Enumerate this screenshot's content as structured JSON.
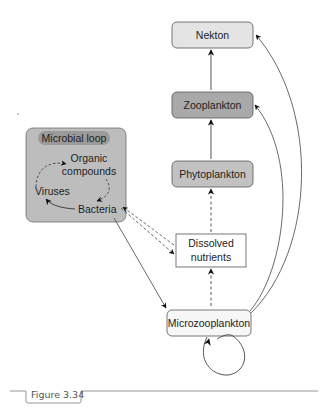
{
  "figure": {
    "caption": "Figure 3.34"
  },
  "nodes": {
    "nekton": {
      "label": "Nekton",
      "fill": "#e4e4e4"
    },
    "zooplankton": {
      "label": "Zooplankton",
      "fill": "#a9a9a9"
    },
    "phytoplankton": {
      "label": "Phytoplankton",
      "fill": "#c2c2c2"
    },
    "dissolved_nutrients": {
      "label_line1": "Dissolved",
      "label_line2": "nutrients",
      "fill": "#ffffff"
    },
    "microzooplankton": {
      "label": "Microzooplankton",
      "fill": "#f7f7f7"
    }
  },
  "microbial_loop": {
    "title": "Microbial loop",
    "panel_fill": "#bdbdbd",
    "title_fill": "#9a9a9a",
    "items": {
      "organic_line1": "Organic",
      "organic_line2": "compounds",
      "viruses": "Viruses",
      "bacteria": "Bacteria"
    }
  },
  "edges": [
    {
      "from": "Zooplankton",
      "to": "Nekton",
      "style": "solid"
    },
    {
      "from": "Phytoplankton",
      "to": "Zooplankton",
      "style": "solid"
    },
    {
      "from": "Dissolved nutrients",
      "to": "Phytoplankton",
      "style": "dashed"
    },
    {
      "from": "Microzooplankton",
      "to": "Dissolved nutrients",
      "style": "dashed"
    },
    {
      "from": "Bacteria",
      "to": "Dissolved nutrients",
      "style": "dashed"
    },
    {
      "from": "Dissolved nutrients",
      "to": "Bacteria",
      "style": "dashed"
    },
    {
      "from": "Bacteria",
      "to": "Microzooplankton",
      "style": "solid"
    },
    {
      "from": "Microzooplankton",
      "to": "Zooplankton",
      "style": "solid-curve"
    },
    {
      "from": "Microzooplankton",
      "to": "Nekton",
      "style": "solid-curve"
    },
    {
      "from": "Microzooplankton",
      "to": "Microzooplankton",
      "style": "self-loop"
    },
    {
      "from": "Organic compounds",
      "to": "Bacteria",
      "style": "dashed-curve"
    },
    {
      "from": "Bacteria",
      "to": "Viruses",
      "style": "solid-curve"
    },
    {
      "from": "Viruses",
      "to": "Organic compounds",
      "style": "dashed-curve"
    }
  ]
}
